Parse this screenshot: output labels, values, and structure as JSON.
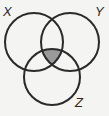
{
  "diagram": {
    "type": "venn",
    "sets": [
      {
        "label": "X",
        "cx": 34,
        "cy": 42,
        "r": 29
      },
      {
        "label": "Y",
        "cx": 70,
        "cy": 42,
        "r": 29
      },
      {
        "label": "Z",
        "cx": 52,
        "cy": 77,
        "r": 28
      }
    ],
    "shaded_region": "X ∩ Y ∩ Z",
    "colors": {
      "stroke": "#2a2a2a",
      "shade": "#9a9a9a",
      "background": "#f4f4f2"
    }
  }
}
